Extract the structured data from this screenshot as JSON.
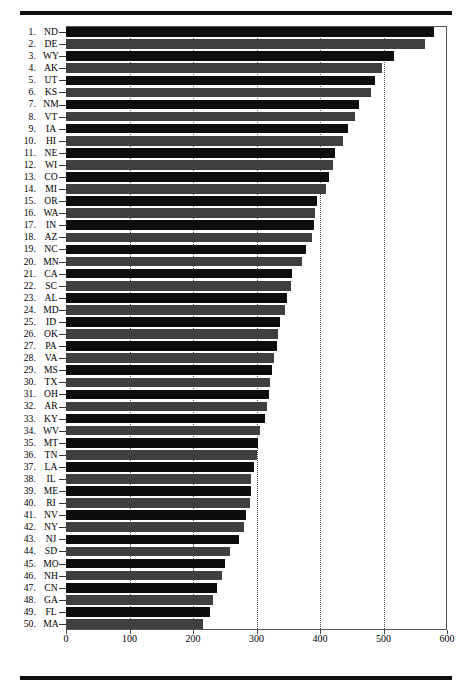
{
  "figure": {
    "title": "",
    "top_rule": "horizontal-rule",
    "bottom_rule": "horizontal-rule"
  },
  "axis": {
    "x_ticks": [
      "0",
      "100",
      "200",
      "300",
      "400",
      "500",
      "600"
    ],
    "x_tick_values": [
      0,
      100,
      200,
      300,
      400,
      500,
      600
    ],
    "xlim_min": 0,
    "xlim_max": 600,
    "gridlines": [
      100,
      200,
      300,
      400,
      500
    ],
    "grid_style": "dotted",
    "x_label": "",
    "y_label": ""
  },
  "colors": {
    "bar_dark": "#0d0d0d",
    "bar_mid": "#3f3f3f",
    "axis": "#555555",
    "grid": "#4a4a4a",
    "rule": "#111111",
    "background": "#ffffff"
  },
  "chart_data": {
    "type": "bar",
    "orientation": "horizontal",
    "title": "",
    "subtitle": "",
    "xlabel": "",
    "ylabel": "",
    "xlim": [
      0,
      600
    ],
    "grid": true,
    "legend": "none",
    "categories": [
      "ND",
      "DE",
      "WY",
      "AK",
      "UT",
      "KS",
      "NM",
      "VT",
      "IA",
      "HI",
      "NE",
      "WI",
      "CO",
      "MI",
      "OR",
      "WA",
      "IN",
      "AZ",
      "NC",
      "MN",
      "CA",
      "SC",
      "AL",
      "MD",
      "ID",
      "OK",
      "PA",
      "VA",
      "MS",
      "TX",
      "OH",
      "AR",
      "KY",
      "WV",
      "MT",
      "TN",
      "LA",
      "IL",
      "ME",
      "RI",
      "NV",
      "NY",
      "NJ",
      "SD",
      "MO",
      "NH",
      "CN",
      "GA",
      "FL",
      "MA"
    ],
    "ranks": [
      "1.",
      "2.",
      "3.",
      "4.",
      "5.",
      "6.",
      "7.",
      "8.",
      "9.",
      "10.",
      "11.",
      "12.",
      "13.",
      "14.",
      "15.",
      "16.",
      "17.",
      "18.",
      "19.",
      "20.",
      "21.",
      "22.",
      "23.",
      "24.",
      "25.",
      "26.",
      "27.",
      "28.",
      "29.",
      "30.",
      "31.",
      "32.",
      "33.",
      "34.",
      "35.",
      "36.",
      "37.",
      "38.",
      "39.",
      "40.",
      "41.",
      "42.",
      "43.",
      "44.",
      "45.",
      "46.",
      "47.",
      "48.",
      "49.",
      "50."
    ],
    "values": [
      580,
      565,
      517,
      498,
      487,
      480,
      462,
      455,
      444,
      437,
      424,
      420,
      414,
      410,
      396,
      392,
      390,
      388,
      378,
      372,
      356,
      354,
      348,
      345,
      337,
      334,
      332,
      328,
      324,
      322,
      320,
      316,
      314,
      305,
      303,
      300,
      296,
      292,
      292,
      290,
      283,
      281,
      273,
      258,
      251,
      245,
      238,
      231,
      226,
      216
    ],
    "series": [
      {
        "name": "value",
        "values": [
          580,
          565,
          517,
          498,
          487,
          480,
          462,
          455,
          444,
          437,
          424,
          420,
          414,
          410,
          396,
          392,
          390,
          388,
          378,
          372,
          356,
          354,
          348,
          345,
          337,
          334,
          332,
          328,
          324,
          322,
          320,
          316,
          314,
          305,
          303,
          300,
          296,
          292,
          292,
          290,
          283,
          281,
          273,
          258,
          251,
          245,
          238,
          231,
          226,
          216
        ]
      }
    ]
  }
}
